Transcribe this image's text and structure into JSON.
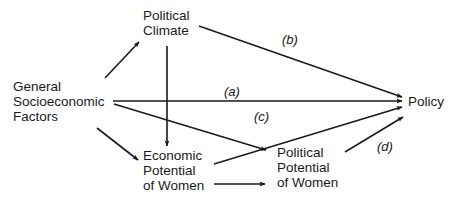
{
  "diagram": {
    "nodes": {
      "political_climate": {
        "lines": [
          "Political",
          "Climate"
        ]
      },
      "general_factors": {
        "lines": [
          "General",
          "Socioeconomic",
          "Factors"
        ]
      },
      "policy": {
        "lines": [
          "Policy"
        ]
      },
      "economic_potential": {
        "lines": [
          "Economic",
          "Potential",
          "of Women"
        ]
      },
      "political_potential": {
        "lines": [
          "Political",
          "Potential",
          "of Women"
        ]
      }
    },
    "path_labels": {
      "a": "(a)",
      "b": "(b)",
      "c": "(c)",
      "d": "(d)"
    },
    "edges": [
      {
        "from": "General Socioeconomic Factors",
        "to": "Political Climate"
      },
      {
        "from": "Political Climate",
        "to": "Policy",
        "label": "(b)"
      },
      {
        "from": "Political Climate",
        "to": "Economic Potential of Women"
      },
      {
        "from": "General Socioeconomic Factors",
        "to": "Policy",
        "label": "(a)"
      },
      {
        "from": "General Socioeconomic Factors",
        "to": "Political Potential of Women"
      },
      {
        "from": "General Socioeconomic Factors",
        "to": "Economic Potential of Women"
      },
      {
        "from": "Economic Potential of Women",
        "to": "Policy",
        "label": "(c)"
      },
      {
        "from": "Economic Potential of Women",
        "to": "Political Potential of Women"
      },
      {
        "from": "Political Potential of Women",
        "to": "Policy",
        "label": "(d)"
      }
    ],
    "colors": {
      "ink": "#1a1a1a",
      "background": "#ffffff"
    }
  }
}
